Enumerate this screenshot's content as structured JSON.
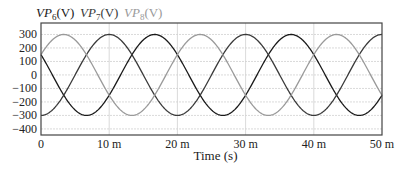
{
  "chart_data": {
    "type": "line",
    "title": "",
    "xlabel": "Time (s)",
    "ylabel": "",
    "xlim": [
      0,
      50
    ],
    "ylim": [
      -445,
      385
    ],
    "x_unit": "ms",
    "grid": true,
    "legend_position": "top-left",
    "x_ticks": [
      0,
      10,
      20,
      30,
      40,
      50
    ],
    "x_tick_labels": [
      "0",
      "10 m",
      "20 m",
      "30 m",
      "40 m",
      "50 m"
    ],
    "y_ticks": [
      300,
      200,
      100,
      0,
      -100,
      -200,
      -300,
      -400
    ],
    "y_tick_labels": [
      "300",
      "200",
      "100",
      "0",
      "-100",
      "-200",
      "-300",
      "-400"
    ],
    "waveform": {
      "amplitude": 300,
      "frequency_hz": 50,
      "period_ms": 20
    },
    "series": [
      {
        "name": "VP6(V)",
        "base": "VP",
        "sub": "6",
        "unit": "(V)",
        "color": "#1a1a1a",
        "peak_time_ms": 16.67,
        "phase_deg": -300,
        "value_at_0": 150
      },
      {
        "name": "VP7(V)",
        "base": "VP",
        "sub": "7",
        "unit": "(V)",
        "color": "#3a3a3a",
        "peak_time_ms": 10.0,
        "phase_deg": -180,
        "value_at_0": -300
      },
      {
        "name": "VP8(V)",
        "base": "VP",
        "sub": "8",
        "unit": "(V)",
        "color": "#9a9a9a",
        "peak_time_ms": 3.33,
        "phase_deg": -60,
        "value_at_0": 150
      }
    ]
  },
  "layout": {
    "plot_left": 41,
    "plot_right": 382,
    "plot_top": 23,
    "plot_bottom": 135
  }
}
